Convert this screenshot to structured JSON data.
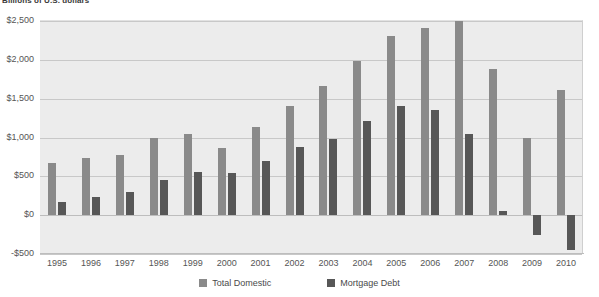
{
  "chart_data": {
    "type": "bar",
    "title": "Billions of U.S. dollars",
    "xlabel": "",
    "ylabel": "",
    "ylim": [
      -500,
      2500
    ],
    "yticks": [
      2500,
      2000,
      1500,
      1000,
      500,
      0,
      -500
    ],
    "ytick_labels": [
      "$2,500",
      "$2,000",
      "$1,500",
      "$1,000",
      "$500",
      "$0",
      "-$500"
    ],
    "grid": true,
    "legend_position": "bottom",
    "categories": [
      "1995",
      "1996",
      "1997",
      "1998",
      "1999",
      "2000",
      "2001",
      "2002",
      "2003",
      "2004",
      "2005",
      "2006",
      "2007",
      "2008",
      "2009",
      "2010"
    ],
    "series": [
      {
        "name": "Total Domestic",
        "color": "#8a8a8a",
        "values": [
          670,
          730,
          780,
          990,
          1040,
          870,
          1140,
          1410,
          1660,
          1980,
          2310,
          2410,
          2500,
          1880,
          1000,
          1610
        ]
      },
      {
        "name": "Mortgage Debt",
        "color": "#575757",
        "values": [
          175,
          235,
          295,
          450,
          560,
          545,
          700,
          880,
          980,
          1210,
          1400,
          1360,
          1050,
          60,
          -255,
          -450
        ]
      }
    ]
  },
  "legend": {
    "items": [
      {
        "label": "Total Domestic",
        "swatch": "total"
      },
      {
        "label": "Mortgage Debt",
        "swatch": "mortgage"
      }
    ]
  }
}
